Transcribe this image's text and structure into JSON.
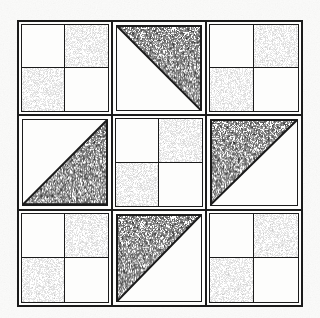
{
  "figure": {
    "name": "quilt-block-diagram",
    "background_color": "#fbfbfa",
    "line_color": "#1b1b1b",
    "fabric_colors": {
      "light": "#fdfdfc",
      "medium": "#f2f2f0",
      "dark": "#1b1b1b"
    },
    "border": {
      "label": "outer-frame",
      "stroke_width_px": 2.5
    },
    "grid": {
      "rows": 3,
      "columns": 3,
      "unit_count": 9
    }
  },
  "units": [
    {
      "position": "top-left",
      "row": 0,
      "col": 0,
      "type": "four-patch",
      "label": "Four-patch",
      "patches": [
        "light",
        "medium",
        "medium",
        "light"
      ]
    },
    {
      "position": "top-center",
      "row": 0,
      "col": 1,
      "type": "half-square-triangle",
      "label": "Half-square triangle",
      "dark_corner": "upper-right",
      "triangle_points": "100,0 100,100 0,0"
    },
    {
      "position": "top-right",
      "row": 0,
      "col": 2,
      "type": "four-patch",
      "label": "Four-patch",
      "patches": [
        "light",
        "medium",
        "medium",
        "light"
      ]
    },
    {
      "position": "middle-left",
      "row": 1,
      "col": 0,
      "type": "half-square-triangle",
      "label": "Half-square triangle",
      "dark_corner": "lower-right",
      "triangle_points": "100,0 100,100 0,100"
    },
    {
      "position": "center",
      "row": 1,
      "col": 1,
      "type": "four-patch",
      "label": "Four-patch",
      "patches": [
        "light",
        "medium",
        "medium",
        "light"
      ]
    },
    {
      "position": "middle-right",
      "row": 1,
      "col": 2,
      "type": "half-square-triangle",
      "label": "Half-square triangle",
      "dark_corner": "upper-left",
      "triangle_points": "0,0 100,0 0,100"
    },
    {
      "position": "bottom-left",
      "row": 2,
      "col": 0,
      "type": "four-patch",
      "label": "Four-patch",
      "patches": [
        "light",
        "medium",
        "medium",
        "light"
      ]
    },
    {
      "position": "bottom-center",
      "row": 2,
      "col": 1,
      "type": "half-square-triangle",
      "label": "Half-square triangle",
      "dark_corner": "upper-left",
      "triangle_points": "0,0 100,0 0,100"
    },
    {
      "position": "bottom-right",
      "row": 2,
      "col": 2,
      "type": "four-patch",
      "label": "Four-patch",
      "patches": [
        "light",
        "medium",
        "medium",
        "light"
      ]
    }
  ]
}
